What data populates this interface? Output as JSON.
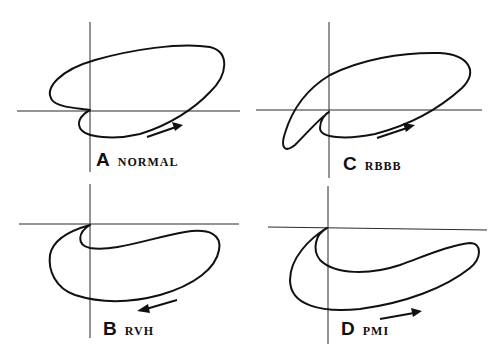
{
  "figure": {
    "panels": [
      {
        "id": "A",
        "letter": "A",
        "name": "NORMAL",
        "arrow_direction": "right"
      },
      {
        "id": "B",
        "letter": "B",
        "name": "RVH",
        "arrow_direction": "left"
      },
      {
        "id": "C",
        "letter": "C",
        "name": "RBBB",
        "arrow_direction": "right"
      },
      {
        "id": "D",
        "letter": "D",
        "name": "PMI",
        "arrow_direction": "right"
      }
    ]
  },
  "colors": {
    "background": "#ffffff",
    "ink": "#111111",
    "axis": "#2a2a2a"
  }
}
